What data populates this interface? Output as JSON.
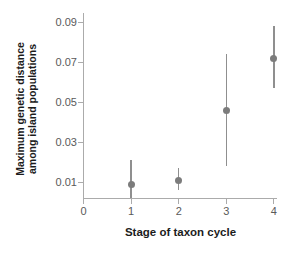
{
  "figure": {
    "background": "#ffffff"
  },
  "chart_data": {
    "type": "scatter",
    "title": "",
    "xlabel": "Stage of taxon cycle",
    "ylabel": "Maximum genetic distance among island populations",
    "ylabel_lines": [
      "Maximum genetic distance",
      "among island populations"
    ],
    "x_ticks": [
      0,
      1,
      2,
      3,
      4
    ],
    "x_tick_labels": [
      "0",
      "1",
      "2",
      "3",
      "4"
    ],
    "y_ticks": [
      0.01,
      0.03,
      0.05,
      0.07,
      0.09
    ],
    "y_tick_labels": [
      "0.01",
      "0.03",
      "0.05",
      "0.07",
      "0.09"
    ],
    "xlim": [
      0,
      4.1
    ],
    "ylim": [
      0.002,
      0.0945
    ],
    "grid": false,
    "legend": null,
    "series": [
      {
        "name": "maximum-genetic-distance",
        "marker": "circle",
        "x": [
          1,
          2,
          3,
          4
        ],
        "y": [
          0.009,
          0.011,
          0.046,
          0.072
        ],
        "error_low": [
          0.002,
          0.006,
          0.018,
          0.057
        ],
        "error_high": [
          0.021,
          0.017,
          0.074,
          0.088
        ],
        "note": "stage-1 lower error bar is clipped at the axis baseline"
      }
    ],
    "colors": {
      "point": "#7c7c7c",
      "error_bar": "#8f8f8f",
      "axis": "#ababab",
      "tick_label": "#5a5a5a",
      "axis_title": "#1c1c1c"
    }
  }
}
